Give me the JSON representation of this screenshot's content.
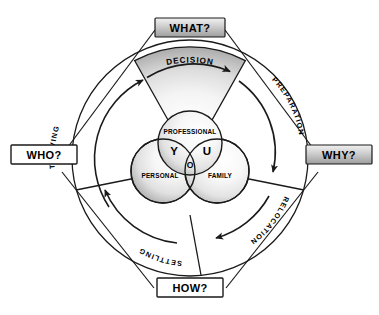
{
  "diagram": {
    "colors": {
      "line": "#1a1a1a",
      "text": "#000000",
      "background": "#ffffff",
      "label_fill_gray_light": "#e8e8e8",
      "label_fill_gray_dark": "#9a9a9a",
      "label_fill_white": "#ffffff",
      "wedge_light": "#ffffff",
      "wedge_dark": "#a8a8a8",
      "circle_light": "#fbfbfb",
      "circle_dark": "#9e9e9e"
    },
    "corner_labels": [
      {
        "id": "what",
        "text": "WHAT?",
        "position": "top",
        "style": "gray"
      },
      {
        "id": "why",
        "text": "WHY?",
        "position": "right",
        "style": "gray"
      },
      {
        "id": "how",
        "text": "HOW?",
        "position": "bottom",
        "style": "white"
      },
      {
        "id": "who",
        "text": "WHO?",
        "position": "left",
        "style": "white"
      }
    ],
    "wedge": {
      "label": "DECISION",
      "position": "top",
      "arrow_direction": "clockwise"
    },
    "ring_phases": [
      {
        "id": "thriving",
        "text": "THRIVING",
        "position": "upper-left",
        "arrow_direction": "up-right"
      },
      {
        "id": "preparation",
        "text": "PREPARATION",
        "position": "upper-right",
        "arrow_direction": "down"
      },
      {
        "id": "relocation",
        "text": "RELOCATION",
        "position": "lower-right",
        "arrow_direction": "down-left"
      },
      {
        "id": "settling",
        "text": "SETTLING",
        "position": "lower-left",
        "arrow_direction": "up-left"
      }
    ],
    "venn": {
      "circles": [
        {
          "id": "professional",
          "label": "PROFESSIONAL",
          "position": "top"
        },
        {
          "id": "personal",
          "label": "PERSONAL",
          "position": "bottom-left"
        },
        {
          "id": "family",
          "label": "FAMILY",
          "position": "bottom-right"
        }
      ],
      "overlap_letters": [
        {
          "id": "y",
          "text": "Y",
          "position": "top-left-overlap"
        },
        {
          "id": "u",
          "text": "U",
          "position": "top-right-overlap"
        },
        {
          "id": "o",
          "text": "O",
          "position": "center-overlap"
        }
      ],
      "word": "YOU"
    }
  }
}
